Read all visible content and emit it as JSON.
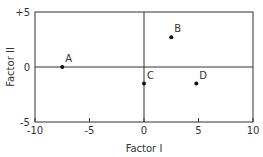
{
  "chart_data": {
    "type": "scatter",
    "title": "",
    "xlabel": "Factor I",
    "ylabel": "Factor II",
    "xlim": [
      -10,
      10
    ],
    "ylim": [
      -5,
      5
    ],
    "xticks": [
      "-10",
      "-5",
      "0",
      "5",
      "10"
    ],
    "yticks": [
      "+5",
      "0",
      "-5"
    ],
    "grid": false,
    "reference_lines": {
      "x": 0,
      "y": 0
    },
    "points": [
      {
        "label": "A",
        "x": -7.5,
        "y": 0
      },
      {
        "label": "B",
        "x": 2.5,
        "y": 2.7
      },
      {
        "label": "C",
        "x": 0,
        "y": -1.5
      },
      {
        "label": "D",
        "x": 4.8,
        "y": -1.5
      }
    ]
  }
}
